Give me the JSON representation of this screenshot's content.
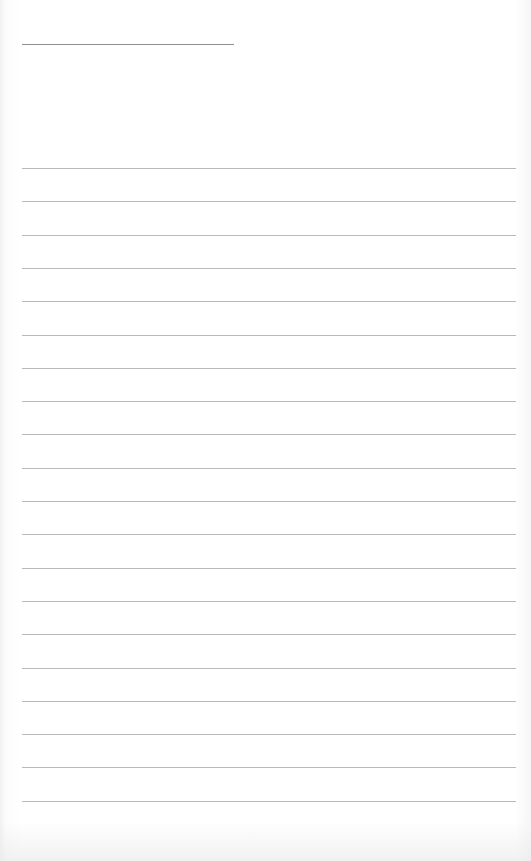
{
  "page": {
    "type": "lined-notepaper",
    "background_color": "#ffffff",
    "title_line": {
      "x": 22,
      "y": 44,
      "width": 212,
      "color": "#8e8e8e"
    },
    "rules": {
      "count": 20,
      "first_y": 168,
      "spacing": 33,
      "x": 22,
      "width": 494,
      "color": "#b9b9b9"
    }
  }
}
